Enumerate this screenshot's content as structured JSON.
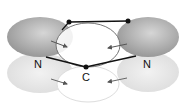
{
  "diagram": {
    "labels": {
      "n_left": "N",
      "c_center": "C",
      "n_right": "N"
    },
    "colors": {
      "lobe_dark": "#9a9a9a",
      "lobe_light": "#e2e2e2",
      "bond": "#111111",
      "orbital_outline": "#777777"
    }
  }
}
